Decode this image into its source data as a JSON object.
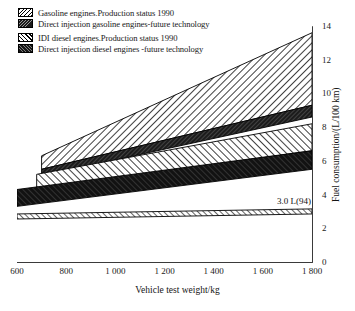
{
  "legend": {
    "groups": [
      {
        "rows": [
          {
            "swatch": "hatch-light-backslash",
            "label": "Gasoline engines.Production status 1990",
            "key": "gasoline_1990"
          },
          {
            "swatch": "solid-dark-speckled",
            "label": "Direct injection gasoline engines-future technology",
            "key": "di_gasoline_future"
          }
        ]
      },
      {
        "rows": [
          {
            "swatch": "hatch-light-slash",
            "label": "IDI  diesel engines.Production status 1990",
            "key": "idi_diesel_1990"
          },
          {
            "swatch": "solid-dark",
            "label": "Direct injection diesel engines -future technology",
            "key": "di_diesel_future"
          }
        ]
      }
    ]
  },
  "annotations": {
    "three_litre": "3.0 L(94)"
  },
  "axes": {
    "x_title": "Vehicle test weight/kg",
    "y_title": "Fuel consumption/(L/100 km)",
    "x_ticks": [
      "600",
      "800",
      "1 000",
      "1 200",
      "1 400",
      "1 600",
      "1 800"
    ],
    "y_ticks": [
      "0",
      "2",
      "4",
      "6",
      "8",
      "10",
      "12",
      "14"
    ]
  },
  "chart_data": {
    "type": "area",
    "title": "",
    "subtitle": "",
    "xlabel": "Vehicle test weight/kg",
    "ylabel": "Fuel consumption/(L/100 km)",
    "xlim": [
      600,
      1800
    ],
    "ylim": [
      0,
      14
    ],
    "x_ticks": [
      600,
      800,
      1000,
      1200,
      1400,
      1600,
      1800
    ],
    "y_ticks": [
      0,
      2,
      4,
      6,
      8,
      10,
      12,
      14
    ],
    "grid": false,
    "legend_position": "above-plot-left",
    "x_unit": "kg",
    "y_unit": "L/100 km",
    "bands": [
      {
        "name": "Gasoline engines.Production status 1990",
        "key": "gasoline_1990",
        "fill": "hatch-light-backslash",
        "x_start": 700,
        "x_end": 1800,
        "lower": [
          {
            "x": 700,
            "y": 5.5
          },
          {
            "x": 1800,
            "y": 9.3
          }
        ],
        "upper": [
          {
            "x": 700,
            "y": 6.3
          },
          {
            "x": 1800,
            "y": 13.6
          }
        ]
      },
      {
        "name": "Direct injection gasoline engines-future technology",
        "key": "di_gasoline_future",
        "fill": "solid-dark-speckled",
        "x_start": 700,
        "x_end": 1800,
        "lower": [
          {
            "x": 700,
            "y": 5.1
          },
          {
            "x": 1800,
            "y": 8.6
          }
        ],
        "upper": [
          {
            "x": 700,
            "y": 5.5
          },
          {
            "x": 1800,
            "y": 9.3
          }
        ]
      },
      {
        "name": "IDI  diesel engines.Production status 1990",
        "key": "idi_diesel_1990",
        "fill": "hatch-light-slash",
        "x_start": 680,
        "x_end": 1800,
        "lower": [
          {
            "x": 680,
            "y": 4.3
          },
          {
            "x": 1800,
            "y": 6.6
          }
        ],
        "upper": [
          {
            "x": 680,
            "y": 5.2
          },
          {
            "x": 1800,
            "y": 8.2
          }
        ]
      },
      {
        "name": "Direct injection diesel engines -future technology",
        "key": "di_diesel_future",
        "fill": "solid-dark",
        "x_start": 600,
        "x_end": 1800,
        "lower": [
          {
            "x": 600,
            "y": 3.3
          },
          {
            "x": 1800,
            "y": 5.5
          }
        ],
        "upper": [
          {
            "x": 600,
            "y": 4.3
          },
          {
            "x": 1800,
            "y": 6.6
          }
        ]
      },
      {
        "name": "3.0 L(94) reference band",
        "key": "three_litre_band",
        "fill": "hatch-thin-slash",
        "x_start": 600,
        "x_end": 1800,
        "lower": [
          {
            "x": 600,
            "y": 2.55
          },
          {
            "x": 1800,
            "y": 2.85
          }
        ],
        "upper": [
          {
            "x": 600,
            "y": 2.85
          },
          {
            "x": 1800,
            "y": 3.15
          }
        ]
      }
    ]
  }
}
